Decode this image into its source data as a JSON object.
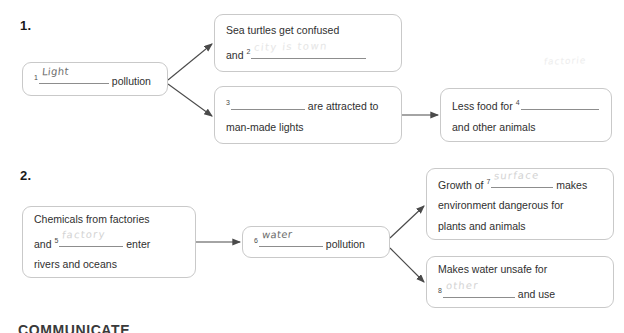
{
  "page": {
    "footer_heading": "COMMUNICATE",
    "stray_note": "factorie"
  },
  "sections": [
    {
      "number": "1.",
      "boxes": {
        "source": {
          "blank_num": "1",
          "answer": "Light",
          "text_after": "pollution"
        },
        "effect_top": {
          "line1": "Sea turtles get confused",
          "line2_before": "and",
          "blank_num": "2",
          "answer": "city is town"
        },
        "effect_bottom": {
          "blank_num": "3",
          "answer": "",
          "line1_after": "are attracted to",
          "line2": "man-made lights"
        },
        "result": {
          "line1_before": "Less food for",
          "blank_num": "4",
          "answer": "",
          "line2": "and other animals"
        }
      }
    },
    {
      "number": "2.",
      "boxes": {
        "source": {
          "line1": "Chemicals from factories",
          "line2_before": "and",
          "blank_num": "5",
          "answer": "factory",
          "line2_after": "enter",
          "line3": "rivers and oceans"
        },
        "middle": {
          "blank_num": "6",
          "answer": "water",
          "text_after": "pollution"
        },
        "effect_top": {
          "line1_before": "Growth of",
          "blank_num": "7",
          "answer": "surface",
          "line1_after": "makes",
          "line2": "environment dangerous for",
          "line3": "plants and animals"
        },
        "effect_bottom": {
          "line1": "Makes water unsafe for",
          "blank_num": "8",
          "answer": "other",
          "line2_after": "and use"
        }
      }
    }
  ],
  "colors": {
    "box_border": "#c9c9c9",
    "blank_rule": "#8d8d8d",
    "arrow": "#555555",
    "text": "#2f2f2f"
  }
}
